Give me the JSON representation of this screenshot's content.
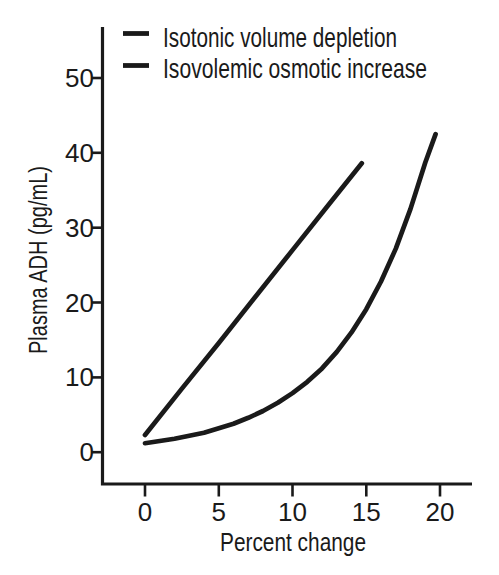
{
  "figure": {
    "legend": {
      "items": [
        {
          "label": "Isotonic volume depletion",
          "marker": "thick-black-dash"
        },
        {
          "label": "Isovolemic osmotic increase",
          "marker": "thick-black-dash"
        }
      ]
    },
    "axes": {
      "x": {
        "label": "Percent change",
        "ticks": [
          "0",
          "5",
          "10",
          "15",
          "20"
        ]
      },
      "y": {
        "label": "Plasma ADH (pg/mL)",
        "ticks": [
          "0",
          "10",
          "20",
          "30",
          "40",
          "50"
        ]
      }
    }
  },
  "colors": {
    "ink": "#1a1a1a",
    "background": "#ffffff"
  },
  "chart_data": {
    "type": "line",
    "title": "",
    "xlabel": "Percent change",
    "ylabel": "Plasma ADH (pg/mL)",
    "xlim": [
      -3,
      22.2
    ],
    "ylim": [
      -4.3,
      56.8
    ],
    "x_ticks": [
      0,
      5,
      10,
      15,
      20
    ],
    "y_ticks": [
      0,
      10,
      20,
      30,
      40,
      50
    ],
    "grid": false,
    "legend_position": "above-plot-top-left",
    "series": [
      {
        "name": "Isotonic volume depletion",
        "shape": "exponential-curve",
        "color": "#1a1a1a",
        "x": [
          0,
          1,
          2,
          3,
          4,
          5,
          6,
          7,
          8,
          9,
          10,
          11,
          12,
          13,
          14,
          15,
          16,
          17,
          18,
          19,
          19.7
        ],
        "y": [
          1.2,
          1.5,
          1.8,
          2.2,
          2.6,
          3.2,
          3.8,
          4.6,
          5.5,
          6.6,
          7.9,
          9.4,
          11.2,
          13.4,
          16.0,
          19.1,
          22.8,
          27.2,
          32.5,
          38.7,
          42.5
        ]
      },
      {
        "name": "Isovolemic osmotic increase",
        "shape": "straight-line",
        "color": "#1a1a1a",
        "x": [
          0,
          2.5,
          5,
          7.5,
          10,
          12.5,
          14.7
        ],
        "y": [
          2.3,
          8.5,
          14.6,
          20.8,
          27.0,
          33.2,
          38.6
        ]
      }
    ]
  }
}
